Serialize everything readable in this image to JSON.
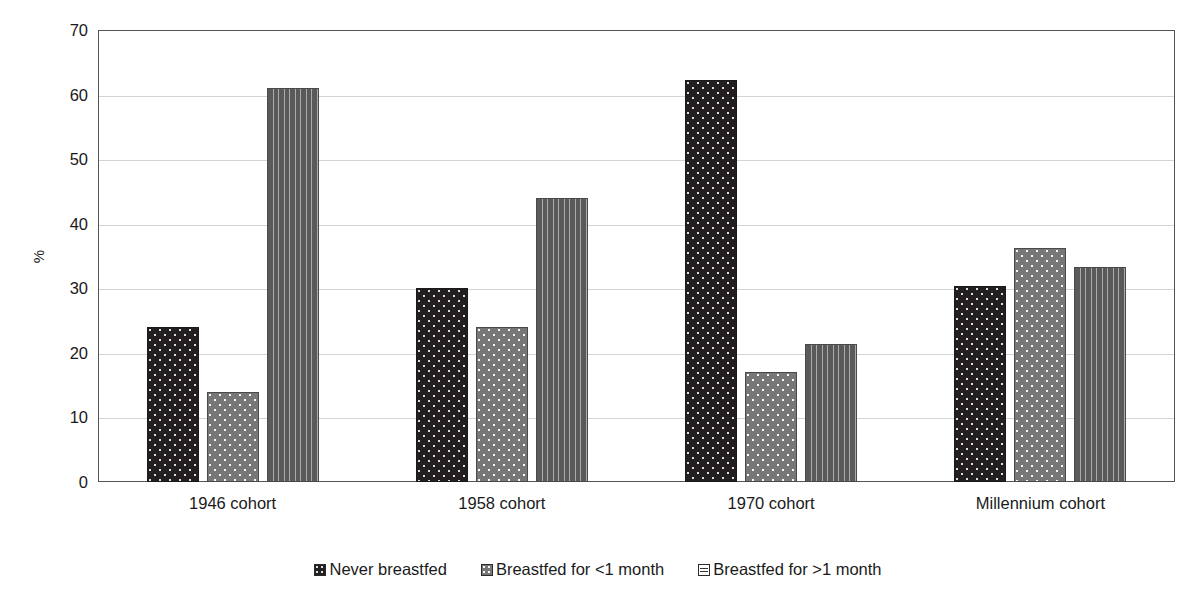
{
  "chart_data": {
    "type": "bar",
    "title": "",
    "xlabel": "",
    "ylabel": "%",
    "ylim": [
      0,
      70
    ],
    "ytick_step": 10,
    "yticks": [
      70,
      60,
      50,
      40,
      30,
      20,
      10,
      0
    ],
    "grid": true,
    "legend_position": "bottom",
    "categories": [
      "1946 cohort",
      "1958 cohort",
      "1970 cohort",
      "Millennium cohort"
    ],
    "series": [
      {
        "name": "Never breastfed",
        "pattern": "dark-speckle",
        "color": "#231f20",
        "values": [
          24.0,
          30.0,
          62.2,
          30.3
        ]
      },
      {
        "name": "Breastfed for <1 month",
        "pattern": "gray-speckle",
        "color": "#777777",
        "values": [
          14.0,
          24.0,
          17.0,
          36.2
        ]
      },
      {
        "name": "Breastfed for >1 month",
        "pattern": "light-dash",
        "color": "#fbfbfb",
        "values": [
          61.0,
          44.0,
          21.3,
          33.3
        ]
      }
    ]
  },
  "axis": {
    "y_label": "%",
    "ticks": [
      {
        "label": "70"
      },
      {
        "label": "60"
      },
      {
        "label": "50"
      },
      {
        "label": "40"
      },
      {
        "label": "30"
      },
      {
        "label": "20"
      },
      {
        "label": "10"
      },
      {
        "label": "0"
      }
    ]
  },
  "categories": [
    {
      "label": "1946 cohort"
    },
    {
      "label": "1958 cohort"
    },
    {
      "label": "1970 cohort"
    },
    {
      "label": "Millennium cohort"
    }
  ],
  "legend": {
    "items": [
      {
        "label": "Never breastfed"
      },
      {
        "label": "Breastfed for <1 month"
      },
      {
        "label": "Breastfed for >1 month"
      }
    ]
  }
}
